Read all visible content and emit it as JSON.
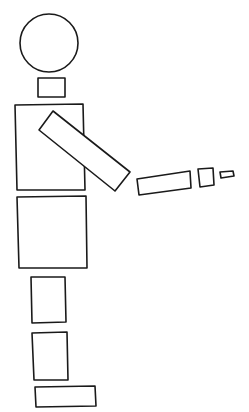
{
  "figure": {
    "stroke_color": "#1a1a1a",
    "background": "#ffffff",
    "parts": {
      "head": {
        "shape": "circle",
        "cx": 49,
        "cy": 43,
        "r": 29
      },
      "neck": {
        "shape": "rect",
        "points": "38,78 65,78 65,97 38,97"
      },
      "torso": {
        "shape": "rect",
        "points": "15,105 83,104 85,190 17,190"
      },
      "upper_arm": {
        "shape": "rotated-rect",
        "points": "53,111 130,172 115,191 39,130"
      },
      "forearm": {
        "shape": "rotated-rect",
        "points": "137,179 190,171 191,188 139,195"
      },
      "hand": {
        "shape": "rect",
        "points": "198,169 213,168 214,185 200,187"
      },
      "finger": {
        "shape": "rect",
        "points": "220,172 233,171 234,176 221,178"
      },
      "hips": {
        "shape": "rect",
        "points": "17,197 86,196 87,268 19,268"
      },
      "upper_leg": {
        "shape": "rect",
        "points": "31,277 65,277 66,322 32,323"
      },
      "lower_leg": {
        "shape": "rect",
        "points": "32,333 67,332 68,380 34,380"
      },
      "foot": {
        "shape": "rect",
        "points": "35,387 95,386 96,406 36,407"
      }
    }
  }
}
